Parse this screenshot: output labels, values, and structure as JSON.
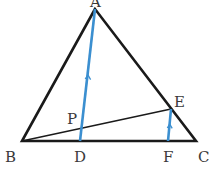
{
  "diagram": {
    "type": "triangle-geometry",
    "points": {
      "A": {
        "label": "A",
        "x": 95,
        "y": 9
      },
      "B": {
        "label": "B",
        "x": 22,
        "y": 141
      },
      "C": {
        "label": "C",
        "x": 196,
        "y": 141
      },
      "D": {
        "label": "D",
        "x": 80,
        "y": 141
      },
      "E": {
        "label": "E",
        "x": 171,
        "y": 109
      },
      "F": {
        "label": "F",
        "x": 168,
        "y": 141
      },
      "P": {
        "label": "P",
        "x": 82,
        "y": 127
      }
    },
    "segments": [
      {
        "from": "A",
        "to": "B",
        "color": "#1a1a1a"
      },
      {
        "from": "A",
        "to": "C",
        "color": "#1a1a1a"
      },
      {
        "from": "B",
        "to": "C",
        "color": "#1a1a1a"
      },
      {
        "from": "B",
        "to": "E",
        "color": "#1a1a1a"
      },
      {
        "from": "A",
        "to": "D",
        "color": "#3b8fd0",
        "parallel_mark": true
      },
      {
        "from": "E",
        "to": "F",
        "color": "#3b8fd0",
        "parallel_mark": true
      }
    ],
    "relations": [
      "AD ∥ EF"
    ],
    "colors": {
      "line": "#1a1a1a",
      "highlight": "#3b8fd0",
      "label": "#3a3a3a"
    }
  }
}
